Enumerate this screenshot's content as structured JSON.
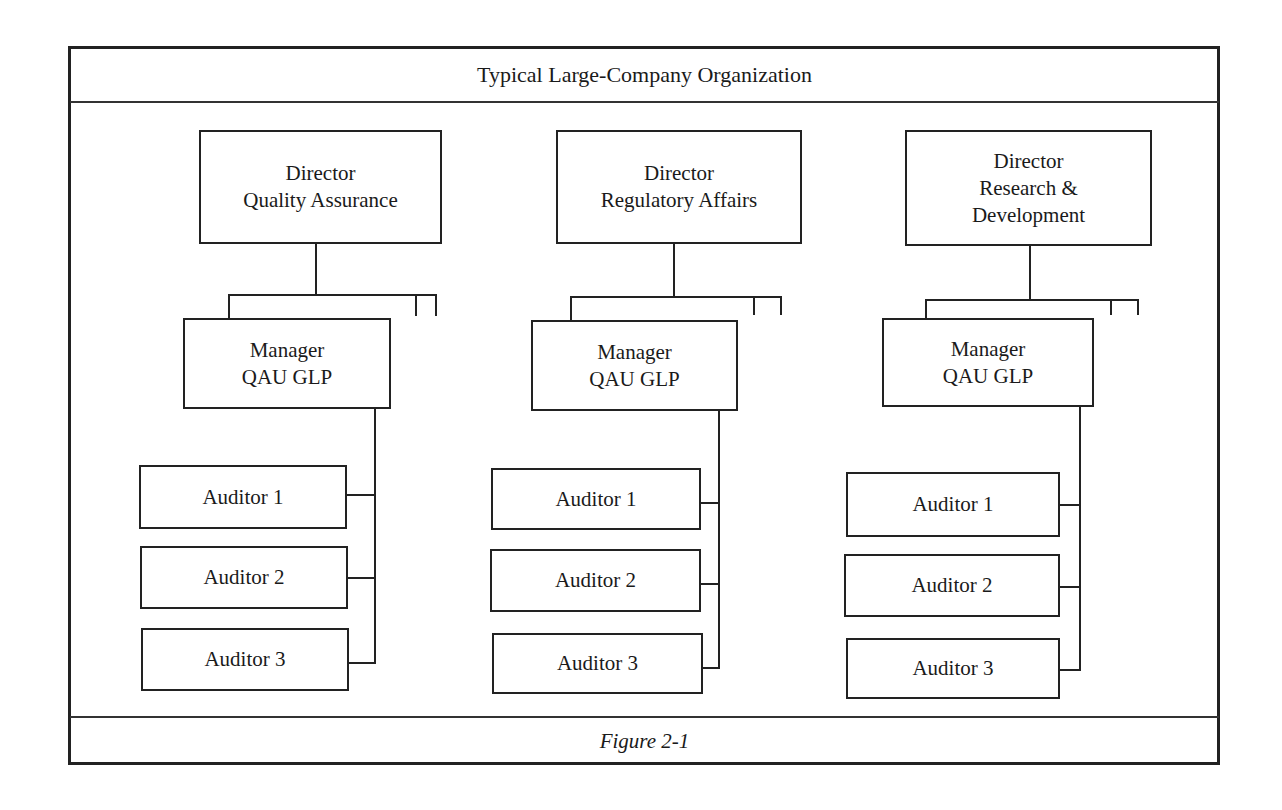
{
  "title": "Typical Large-Company Organization",
  "caption": "Figure 2-1",
  "columns": [
    {
      "director": {
        "line1": "Director",
        "line2": "Quality Assurance",
        "line3": ""
      },
      "manager": {
        "line1": "Manager",
        "line2": "QAU GLP"
      },
      "auditors": [
        "Auditor 1",
        "Auditor 2",
        "Auditor 3"
      ]
    },
    {
      "director": {
        "line1": "Director",
        "line2": "Regulatory Affairs",
        "line3": ""
      },
      "manager": {
        "line1": "Manager",
        "line2": "QAU GLP"
      },
      "auditors": [
        "Auditor 1",
        "Auditor 2",
        "Auditor 3"
      ]
    },
    {
      "director": {
        "line1": "Director",
        "line2": "Research &",
        "line3": "Development"
      },
      "manager": {
        "line1": "Manager",
        "line2": "QAU GLP"
      },
      "auditors": [
        "Auditor 1",
        "Auditor 2",
        "Auditor 3"
      ]
    }
  ],
  "colors": {
    "line": "#222222",
    "background": "#ffffff"
  }
}
